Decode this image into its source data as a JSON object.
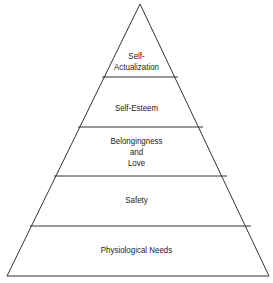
{
  "diagram": {
    "type": "pyramid",
    "levels": [
      {
        "lines": [
          "Self-",
          "Actualization"
        ]
      },
      {
        "lines": [
          "Self-Esteem"
        ]
      },
      {
        "lines": [
          "Belongingness",
          "and",
          "Love"
        ]
      },
      {
        "lines": [
          "Safety"
        ]
      },
      {
        "lines": [
          "Physiological Needs"
        ]
      }
    ],
    "stroke_color": "#333333"
  }
}
